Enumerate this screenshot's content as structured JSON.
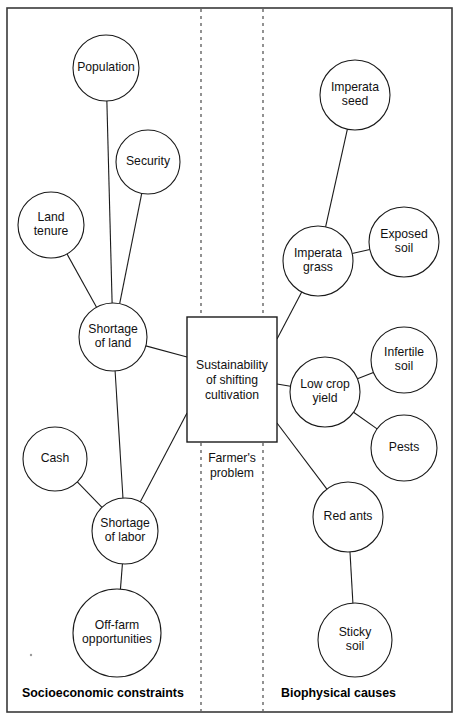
{
  "diagram": {
    "frame": {
      "x": 7,
      "y": 8,
      "width": 445,
      "height": 704
    },
    "colors": {
      "stroke": "#1a1a1a",
      "frame": "#3a3a3a",
      "divider": "#4a4a4a",
      "background": "#ffffff",
      "text": "#111111"
    },
    "dividers": [
      {
        "name": "divider-left",
        "x": 201,
        "y1": 9,
        "y2": 711
      },
      {
        "name": "divider-right",
        "x": 263,
        "y1": 9,
        "y2": 711
      }
    ],
    "center_box": {
      "name": "sustainability-box",
      "x": 187,
      "y": 317,
      "width": 90,
      "height": 125,
      "lines": [
        "Sustainability",
        "of shifting",
        "cultivation"
      ]
    },
    "caption": {
      "name": "farmers-problem-caption",
      "x": 232,
      "y": 462,
      "lines": [
        "Farmer's",
        "problem"
      ]
    },
    "section_labels": [
      {
        "name": "section-socioeconomic",
        "text": "Socioeconomic constraints",
        "x": 22,
        "y": 697
      },
      {
        "name": "section-biophysical",
        "text": "Biophysical causes",
        "x": 281,
        "y": 697
      }
    ],
    "nodes": [
      {
        "id": "population",
        "label": [
          "Population"
        ],
        "cx": 106,
        "cy": 68,
        "r": 33
      },
      {
        "id": "security",
        "label": [
          "Security"
        ],
        "cx": 148,
        "cy": 162,
        "r": 32
      },
      {
        "id": "land_tenure",
        "label": [
          "Land",
          "tenure"
        ],
        "cx": 51,
        "cy": 225,
        "r": 33
      },
      {
        "id": "shortage_of_land",
        "label": [
          "Shortage",
          "of land"
        ],
        "cx": 113,
        "cy": 337,
        "r": 34
      },
      {
        "id": "cash",
        "label": [
          "Cash"
        ],
        "cx": 55,
        "cy": 459,
        "r": 32
      },
      {
        "id": "shortage_of_labor",
        "label": [
          "Shortage",
          "of labor"
        ],
        "cx": 125,
        "cy": 531,
        "r": 33
      },
      {
        "id": "off_farm_opportunities",
        "label": [
          "Off-farm",
          "opportunities"
        ],
        "cx": 117,
        "cy": 633,
        "r": 44
      },
      {
        "id": "imperata_seed",
        "label": [
          "Imperata",
          "seed"
        ],
        "cx": 355,
        "cy": 95,
        "r": 35
      },
      {
        "id": "imperata_grass",
        "label": [
          "Imperata",
          "grass"
        ],
        "cx": 318,
        "cy": 261,
        "r": 35
      },
      {
        "id": "exposed_soil",
        "label": [
          "Exposed",
          "soil"
        ],
        "cx": 404,
        "cy": 242,
        "r": 35
      },
      {
        "id": "low_crop_yield",
        "label": [
          "Low crop",
          "yield"
        ],
        "cx": 325,
        "cy": 392,
        "r": 35
      },
      {
        "id": "infertile_soil",
        "label": [
          "Infertile",
          "soil"
        ],
        "cx": 404,
        "cy": 360,
        "r": 33
      },
      {
        "id": "pests",
        "label": [
          "Pests"
        ],
        "cx": 404,
        "cy": 448,
        "r": 33
      },
      {
        "id": "red_ants",
        "label": [
          "Red ants"
        ],
        "cx": 348,
        "cy": 517,
        "r": 35
      },
      {
        "id": "sticky_soil",
        "label": [
          "Sticky",
          "soil"
        ],
        "cx": 355,
        "cy": 640,
        "r": 37
      }
    ],
    "edges": [
      {
        "id": "population-shortage_of_land",
        "from": "population",
        "to": "shortage_of_land"
      },
      {
        "id": "security-shortage_of_land",
        "from": "security",
        "to": "shortage_of_land"
      },
      {
        "id": "land_tenure-shortage_of_land",
        "from": "land_tenure",
        "to": "shortage_of_land"
      },
      {
        "id": "shortage_of_land-box",
        "from": "shortage_of_land",
        "to": "box_left_upper"
      },
      {
        "id": "shortage_of_land-shortage_of_labor",
        "from": "shortage_of_land",
        "to": "shortage_of_labor"
      },
      {
        "id": "cash-shortage_of_labor",
        "from": "cash",
        "to": "shortage_of_labor"
      },
      {
        "id": "off_farm_opportunities-shortage_of_labor",
        "from": "off_farm_opportunities",
        "to": "shortage_of_labor"
      },
      {
        "id": "shortage_of_labor-box",
        "from": "shortage_of_labor",
        "to": "box_left_lower"
      },
      {
        "id": "imperata_seed-imperata_grass",
        "from": "imperata_seed",
        "to": "imperata_grass"
      },
      {
        "id": "exposed_soil-imperata_grass",
        "from": "exposed_soil",
        "to": "imperata_grass"
      },
      {
        "id": "imperata_grass-box",
        "from": "imperata_grass",
        "to": "box_right_upper"
      },
      {
        "id": "low_crop_yield-box",
        "from": "low_crop_yield",
        "to": "box_right_middle"
      },
      {
        "id": "infertile_soil-low_crop_yield",
        "from": "infertile_soil",
        "to": "low_crop_yield"
      },
      {
        "id": "pests-low_crop_yield",
        "from": "pests",
        "to": "low_crop_yield"
      },
      {
        "id": "red_ants-box",
        "from": "red_ants",
        "to": "box_right_lower"
      },
      {
        "id": "sticky_soil-red_ants",
        "from": "sticky_soil",
        "to": "red_ants"
      }
    ]
  }
}
